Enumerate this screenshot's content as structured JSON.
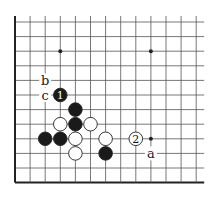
{
  "diagram": {
    "grid": {
      "origin_x": 15,
      "origin_y": 22,
      "spacing_x": 15.1,
      "spacing_y": 14.6,
      "cols": 13,
      "rows": 12,
      "extend_right": 8,
      "left_edge": true,
      "bottom_edge": true,
      "line_color": "#555555",
      "edge_color": "#222222"
    },
    "star_points": [
      {
        "col": 3,
        "row": 2
      },
      {
        "col": 9,
        "row": 2
      },
      {
        "col": 9,
        "row": 8
      }
    ],
    "stones": [
      {
        "color": "black",
        "col": 3,
        "row": 5,
        "label": "1"
      },
      {
        "color": "black",
        "col": 4,
        "row": 6,
        "label": ""
      },
      {
        "color": "black",
        "col": 4,
        "row": 7,
        "label": ""
      },
      {
        "color": "white",
        "col": 3,
        "row": 7,
        "label": ""
      },
      {
        "color": "white",
        "col": 5,
        "row": 7,
        "label": ""
      },
      {
        "color": "black",
        "col": 2,
        "row": 8,
        "label": ""
      },
      {
        "color": "black",
        "col": 3,
        "row": 8,
        "label": ""
      },
      {
        "color": "white",
        "col": 4,
        "row": 8,
        "label": ""
      },
      {
        "color": "white",
        "col": 6,
        "row": 8,
        "label": ""
      },
      {
        "color": "white",
        "col": 8,
        "row": 8,
        "label": "2"
      },
      {
        "color": "white",
        "col": 4,
        "row": 9,
        "label": ""
      },
      {
        "color": "black",
        "col": 6,
        "row": 9,
        "label": ""
      }
    ],
    "point_labels": [
      {
        "text": "b",
        "col": 2,
        "row": 4
      },
      {
        "text": "c",
        "col": 2,
        "row": 5
      },
      {
        "text": "a",
        "col": 9,
        "row": 9
      }
    ],
    "colors": {
      "black_stone": "#1a1a1a",
      "white_stone": "#ffffff",
      "stone_outline": "#222222"
    }
  }
}
